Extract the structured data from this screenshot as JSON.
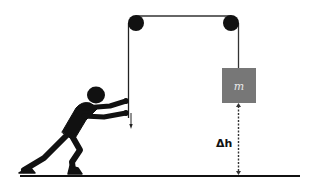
{
  "diagram": {
    "labels": {
      "mass": "m",
      "height_change": "Δh"
    },
    "colors": {
      "ink": "#111111",
      "mass_fill": "#777777",
      "mass_label": "#e8e8e8",
      "background": "#ffffff"
    },
    "elements": {
      "pulleys": [
        {
          "name": "left-pulley",
          "cx": 136,
          "cy": 23,
          "r": 8
        },
        {
          "name": "right-pulley",
          "cx": 231,
          "cy": 23,
          "r": 8
        }
      ],
      "mass_box": {
        "x": 222,
        "y": 68,
        "width": 34,
        "height": 35
      },
      "ground_y": 175
    }
  }
}
